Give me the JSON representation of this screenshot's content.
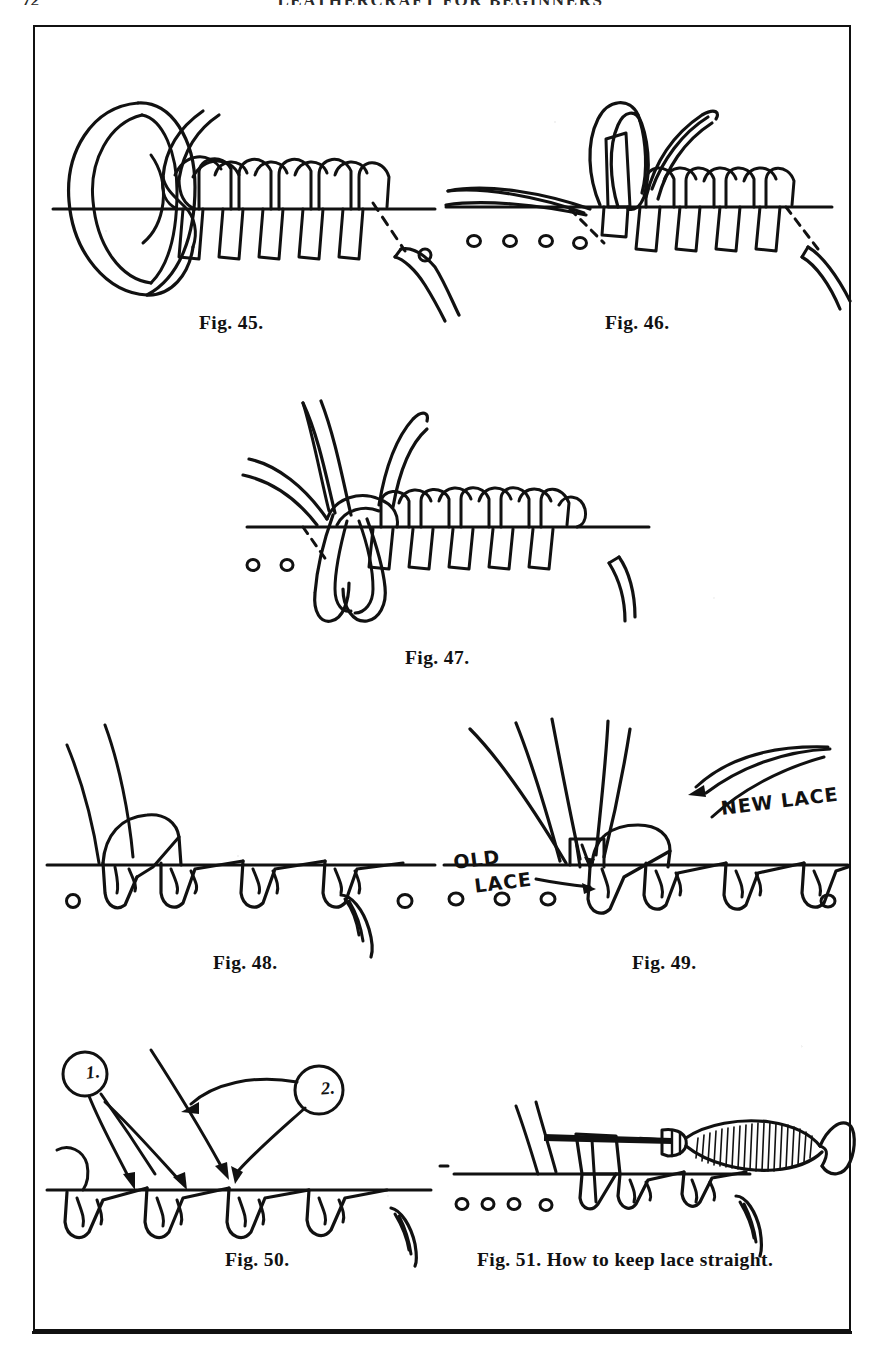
{
  "page": {
    "running_head": "LEATHERCRAFT FOR BEGINNERS",
    "folio": "72",
    "background_color": "#ffffff",
    "ink_color": "#111111"
  },
  "plate": {
    "border_color": "#111111",
    "figures": [
      {
        "id": "fig-45",
        "caption": "Fig. 45.",
        "description": "Whip-stitch lacing start with large loop of lace at left and needle end pulled through at right"
      },
      {
        "id": "fig-46",
        "caption": "Fig. 46.",
        "description": "Lace loop held upright over punched holes with lacing run to the right"
      },
      {
        "id": "fig-47",
        "caption": "Fig. 47.",
        "description": "Lace end drawn down into a hanging loop beneath the completed whip stitches"
      },
      {
        "id": "fig-48",
        "caption": "Fig. 48.",
        "description": "Finished row of slanted whip stitches along the leather edge"
      },
      {
        "id": "fig-49",
        "caption": "Fig. 49.",
        "description": "Splicing lace: old lace tucked under and new lace started",
        "labels": [
          "NEW LACE",
          "OLD LACE"
        ]
      },
      {
        "id": "fig-50",
        "caption": "Fig. 50.",
        "description": "Arrows numbered 1 and 2 showing direction of pull for tightening stitches",
        "callouts": [
          "1.",
          "2."
        ]
      },
      {
        "id": "fig-51",
        "caption": "Fig. 51.  How to keep lace straight.",
        "description": "Wooden-handled awl or fid slipped under the lace to straighten it"
      }
    ]
  }
}
